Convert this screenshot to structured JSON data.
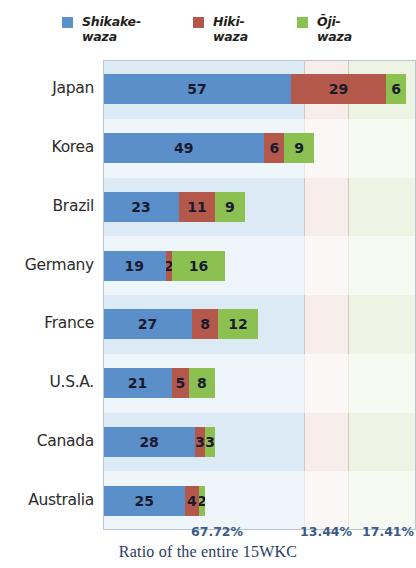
{
  "legend": {
    "items": [
      {
        "label": "Shikake-\nwaza",
        "color": "#5b8fc9",
        "icon": "legend-swatch-blue"
      },
      {
        "label": "Hiki-\nwaza",
        "color": "#b5584c",
        "icon": "legend-swatch-red"
      },
      {
        "label": "Ōji-\nwaza",
        "color": "#8cc152",
        "icon": "legend-swatch-green"
      }
    ]
  },
  "axis": {
    "percent_labels": [
      "67.72%",
      "13.44%",
      "17.41%"
    ]
  },
  "caption": "Ratio of the entire 15WKC",
  "chart_data": {
    "type": "bar",
    "orientation": "horizontal",
    "stacked": true,
    "title": "",
    "subtitle": "",
    "xlabel": "Ratio of the entire 15WKC",
    "ylabel": "",
    "categories": [
      "Japan",
      "Korea",
      "Brazil",
      "Germany",
      "France",
      "U.S.A.",
      "Canada",
      "Australia"
    ],
    "series": [
      {
        "name": "Shikake-waza",
        "color": "#5b8fc9",
        "values": [
          57,
          49,
          23,
          19,
          27,
          21,
          28,
          25
        ]
      },
      {
        "name": "Hiki-waza",
        "color": "#b5584c",
        "values": [
          29,
          6,
          11,
          2,
          8,
          5,
          3,
          4
        ]
      },
      {
        "name": "Ōji-waza",
        "color": "#8cc152",
        "values": [
          6,
          9,
          9,
          16,
          12,
          8,
          3,
          2
        ]
      }
    ],
    "totals": [
      92,
      64,
      43,
      37,
      47,
      34,
      34,
      31
    ],
    "annotations": [
      "67.72%",
      "13.44%",
      "17.41%"
    ],
    "xlim": [
      0,
      95
    ],
    "grid": false,
    "legend_position": "top",
    "background_bands": [
      {
        "color": "#dceaf5",
        "label": "Shikake-waza region"
      },
      {
        "color": "#f7eeec",
        "label": "Hiki-waza region"
      },
      {
        "color": "#eef4e4",
        "label": "Ōji-waza region"
      }
    ]
  }
}
